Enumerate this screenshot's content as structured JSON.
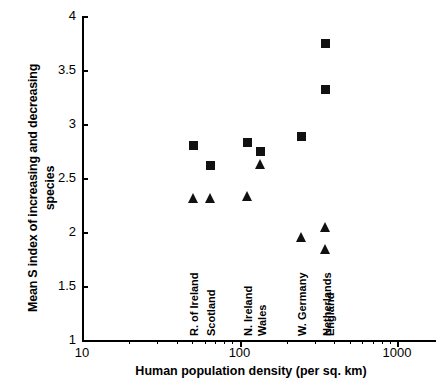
{
  "chart_data": {
    "type": "scatter",
    "title": "",
    "xlabel": "Human population density (per sq. km)",
    "ylabel": "Mean S index of increasing and decreasing species",
    "ylabel_line1": "Mean S index of increasing and decreasing",
    "ylabel_line2": "species",
    "xscale": "log",
    "yscale": "linear",
    "xlim": [
      10,
      1000
    ],
    "ylim": [
      1,
      4
    ],
    "grid": false,
    "legend": "none",
    "xticks": [
      {
        "value": 10,
        "label": "10"
      },
      {
        "value": 100,
        "label": "100"
      },
      {
        "value": 1000,
        "label": "1000"
      }
    ],
    "xminor_ticks": [
      20,
      30,
      40,
      50,
      60,
      70,
      80,
      90,
      200,
      300,
      400,
      500,
      600,
      700,
      800,
      900
    ],
    "yticks": [
      {
        "value": 1,
        "label": "1"
      },
      {
        "value": 1.5,
        "label": "1.5"
      },
      {
        "value": 2,
        "label": "2"
      },
      {
        "value": 2.5,
        "label": "2.5"
      },
      {
        "value": 3,
        "label": "3"
      },
      {
        "value": 3.5,
        "label": "3.5"
      },
      {
        "value": 4,
        "label": "4"
      }
    ],
    "categories": [
      {
        "name": "R. of Ireland",
        "x": 51
      },
      {
        "name": "Scotland",
        "x": 65
      },
      {
        "name": "N. Ireland",
        "x": 112
      },
      {
        "name": "Wales",
        "x": 136
      },
      {
        "name": "W. Germany",
        "x": 246
      },
      {
        "name": "Netherlands",
        "x": 352
      },
      {
        "name": "England",
        "x": 372
      }
    ],
    "series": [
      {
        "name": "square-series",
        "marker": "square",
        "color": "#111111",
        "points": [
          {
            "category": "R. of Ireland",
            "x": 51,
            "y": 2.8
          },
          {
            "category": "Scotland",
            "x": 65,
            "y": 2.62
          },
          {
            "category": "N. Ireland",
            "x": 112,
            "y": 2.83
          },
          {
            "category": "Wales",
            "x": 136,
            "y": 2.75
          },
          {
            "category": "W. Germany",
            "x": 246,
            "y": 2.88
          },
          {
            "category": "Netherlands",
            "x": 352,
            "y": 3.75
          },
          {
            "category": "England",
            "x": 352,
            "y": 3.32
          }
        ]
      },
      {
        "name": "triangle-series",
        "marker": "triangle",
        "color": "#111111",
        "points": [
          {
            "category": "R. of Ireland",
            "x": 51,
            "y": 2.31
          },
          {
            "category": "Scotland",
            "x": 65,
            "y": 2.31
          },
          {
            "category": "N. Ireland",
            "x": 112,
            "y": 2.32
          },
          {
            "category": "Wales",
            "x": 136,
            "y": 2.62
          },
          {
            "category": "W. Germany",
            "x": 246,
            "y": 1.94
          },
          {
            "category": "Netherlands",
            "x": 352,
            "y": 2.04
          },
          {
            "category": "England",
            "x": 352,
            "y": 1.83
          }
        ]
      }
    ]
  }
}
